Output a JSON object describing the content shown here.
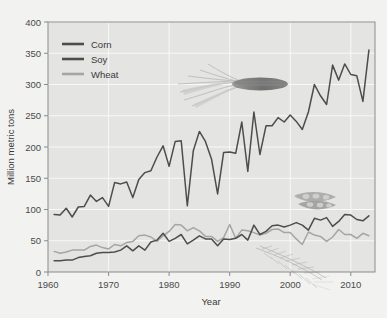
{
  "chart_data": {
    "type": "line",
    "title": "",
    "xlabel": "Year",
    "ylabel": "Million metric tons",
    "xlim": [
      1960,
      2014
    ],
    "ylim": [
      0,
      400
    ],
    "xticks": [
      1960,
      1970,
      1980,
      1990,
      2000,
      2010
    ],
    "yticks": [
      0,
      50,
      100,
      150,
      200,
      250,
      300,
      350,
      400
    ],
    "grid": true,
    "legend_position": "top-left",
    "legend": [
      "Corn",
      "Soy",
      "Wheat"
    ],
    "colors": {
      "corn": "#4d4d4d",
      "soy": "#4d4d4d",
      "wheat": "#a5a5a5",
      "plot_background": "#e4e4e2",
      "page_background": "#f2f2f0",
      "gridline": "#fbfbfb",
      "axis": "#8b8b8b"
    },
    "x": [
      1961,
      1962,
      1963,
      1964,
      1965,
      1966,
      1967,
      1968,
      1969,
      1970,
      1971,
      1972,
      1973,
      1974,
      1975,
      1976,
      1977,
      1978,
      1979,
      1980,
      1981,
      1982,
      1983,
      1984,
      1985,
      1986,
      1987,
      1988,
      1989,
      1990,
      1991,
      1992,
      1993,
      1994,
      1995,
      1996,
      1997,
      1998,
      1999,
      2000,
      2001,
      2002,
      2003,
      2004,
      2005,
      2006,
      2007,
      2008,
      2009,
      2010,
      2011,
      2012,
      2013
    ],
    "series": [
      {
        "name": "Corn",
        "values": [
          92,
          91,
          102,
          88,
          104,
          105,
          123,
          113,
          119,
          105,
          143,
          141,
          144,
          119,
          148,
          159,
          162,
          184,
          202,
          169,
          209,
          210,
          106,
          194,
          225,
          209,
          181,
          125,
          191,
          192,
          190,
          240,
          161,
          256,
          188,
          234,
          234,
          247,
          240,
          251,
          241,
          228,
          256,
          300,
          282,
          268,
          331,
          307,
          333,
          316,
          314,
          273,
          355
        ]
      },
      {
        "name": "Soy",
        "values": [
          18,
          18,
          19,
          19,
          23,
          25,
          26,
          30,
          31,
          31,
          32,
          35,
          42,
          34,
          42,
          35,
          48,
          51,
          62,
          49,
          54,
          60,
          45,
          51,
          58,
          53,
          53,
          42,
          53,
          52,
          54,
          60,
          51,
          75,
          60,
          65,
          74,
          75,
          72,
          75,
          79,
          75,
          67,
          86,
          83,
          87,
          73,
          81,
          92,
          91,
          84,
          82,
          90
        ]
      },
      {
        "name": "Wheat",
        "values": [
          33,
          30,
          32,
          35,
          35,
          35,
          41,
          43,
          39,
          37,
          44,
          42,
          47,
          49,
          58,
          59,
          56,
          49,
          58,
          65,
          76,
          75,
          66,
          71,
          66,
          57,
          57,
          49,
          55,
          76,
          54,
          67,
          66,
          63,
          59,
          62,
          68,
          69,
          63,
          63,
          53,
          44,
          64,
          59,
          57,
          49,
          56,
          68,
          60,
          60,
          54,
          62,
          58
        ]
      }
    ],
    "annotations": [
      {
        "name": "corn-illustration",
        "label": "corn cob with husk"
      },
      {
        "name": "soybean-illustration",
        "label": "soybean pods"
      },
      {
        "name": "wheat-illustration",
        "label": "wheat stalks"
      }
    ]
  }
}
